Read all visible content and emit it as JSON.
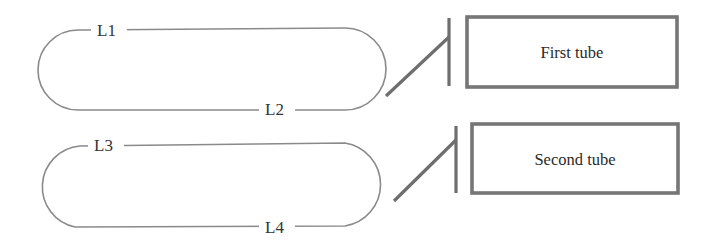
{
  "diagram": {
    "type": "schematic",
    "colors": {
      "loop_stroke": "#8a8a8a",
      "switch_stroke": "#6e6e6e",
      "box_stroke": "#767676",
      "text": "#333333"
    },
    "loops": [
      {
        "id": "loop-1",
        "top_label": "L1",
        "bottom_label": "L2",
        "target": "First tube"
      },
      {
        "id": "loop-2",
        "top_label": "L3",
        "bottom_label": "L4",
        "target": "Second tube"
      }
    ],
    "tubes": [
      {
        "label": "First tube"
      },
      {
        "label": "Second tube"
      }
    ]
  }
}
